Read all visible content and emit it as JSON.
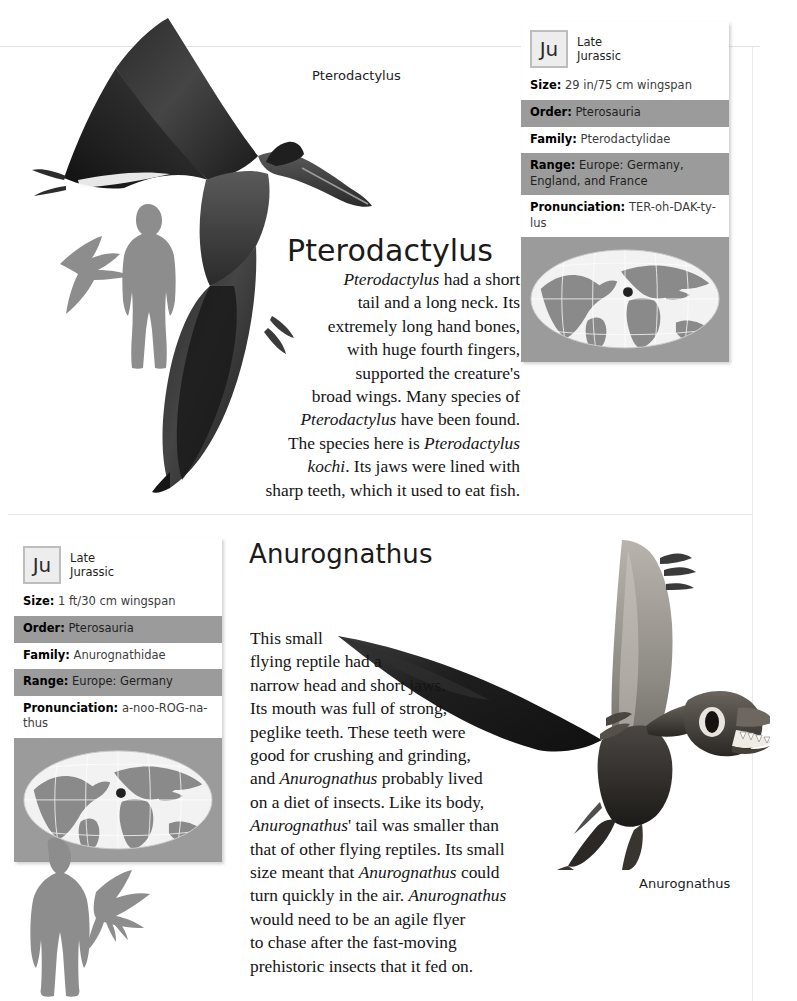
{
  "page": {
    "background": "#ffffff",
    "rule_color": "#e4e4e4"
  },
  "entries": [
    {
      "id": "pterodactylus",
      "title": "Pterodactylus",
      "caption": "Pterodactylus",
      "info": {
        "period_abbr": "Ju",
        "period_line1": "Late",
        "period_line2": "Jurassic",
        "size_label": "Size:",
        "size_value": "29 in/75 cm wingspan",
        "order_label": "Order:",
        "order_value": "Pterosauria",
        "family_label": "Family:",
        "family_value": "Pterodactylidae",
        "range_label": "Range:",
        "range_value": "Europe: Germany, England, and France",
        "pronunciation_label": "Pronunciation:",
        "pronunciation_value": "TER-oh-DAK-ty-lus"
      },
      "body_lines": [
        "Pterodactylus|had a short",
        "tail and a long neck. Its",
        "extremely long hand bones,",
        "with huge fourth fingers,",
        "supported the creature's",
        "broad wings. Many species of",
        "Pterodactylus|have been found.",
        "The species here is |Pterodactylus",
        "kochi|. Its jaws were lined with",
        "sharp teeth, which it used to eat fish."
      ]
    },
    {
      "id": "anurognathus",
      "title": "Anurognathus",
      "caption": "Anurognathus",
      "info": {
        "period_abbr": "Ju",
        "period_line1": "Late",
        "period_line2": "Jurassic",
        "size_label": "Size:",
        "size_value": "1 ft/30 cm wingspan",
        "order_label": "Order:",
        "order_value": "Pterosauria",
        "family_label": "Family:",
        "family_value": "Anurognathidae",
        "range_label": "Range:",
        "range_value": "Europe: Germany",
        "pronunciation_label": "Pronunciation:",
        "pronunciation_value": "a-noo-ROG-na-thus"
      },
      "body_lines": [
        "This small",
        "flying reptile had a",
        "narrow head and short jaws.",
        "Its mouth was full of strong,",
        "peglike teeth. These teeth were",
        "good for crushing and grinding,",
        "and |Anurognathus| probably lived",
        "on a diet of insects. Like its body,",
        "Anurognathus|' tail was smaller than",
        "that of other flying reptiles. Its small",
        "size meant that |Anurognathus| could",
        "turn quickly in the air. |Anurognathus",
        "would need to be an agile flyer",
        "to chase after the fast-moving",
        "prehistoric insects that it fed on."
      ]
    }
  ],
  "colors": {
    "info_gray": "#9b9b9b",
    "info_white": "#ffffff",
    "badge_fill": "#ededed",
    "badge_border": "#bdbdbd",
    "silhouette": "#8c8c8c",
    "map_land": "#8a8a8a",
    "map_ocean": "#f2f2f2",
    "map_marker": "#222222"
  },
  "icons": {
    "period_badge": "jurassic-badge",
    "range_map": "world-map-icon",
    "scale_human": "human-silhouette-icon",
    "scale_pterosaur": "pterosaur-silhouette-icon"
  }
}
